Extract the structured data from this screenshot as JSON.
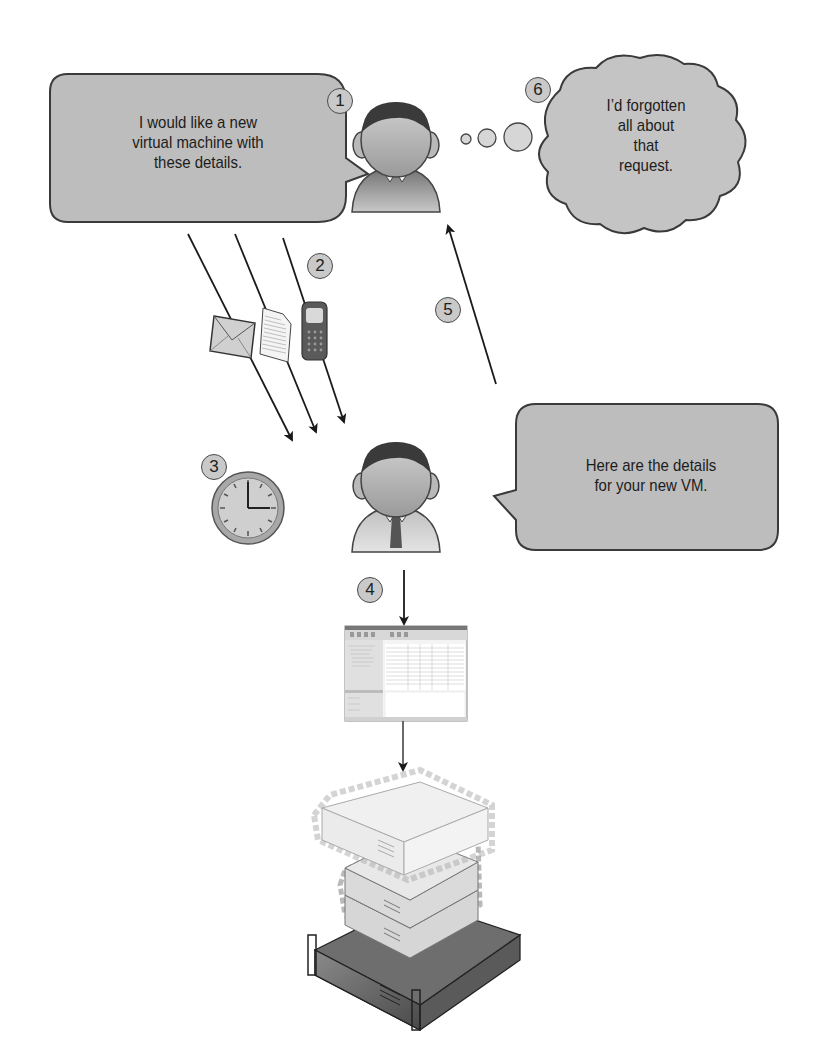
{
  "diagram": {
    "steps": [
      {
        "number": "1",
        "label": "Requester asks for a new VM"
      },
      {
        "number": "2",
        "label": "Request sent via email, document, or phone"
      },
      {
        "number": "3",
        "label": "Waiting time"
      },
      {
        "number": "4",
        "label": "Administrator provisions VM via management console"
      },
      {
        "number": "5",
        "label": "Administrator returns VM details"
      },
      {
        "number": "6",
        "label": "Requester has forgotten the request"
      }
    ],
    "bubbles": {
      "requester_speech": {
        "line1": "I would like a new",
        "line2": "virtual machine with",
        "line3": "these details."
      },
      "requester_thought": {
        "line1": "I’d forgotten",
        "line2": "all about",
        "line3": "that",
        "line4": "request."
      },
      "admin_speech": {
        "line1": "Here are the details",
        "line2": "for your new VM."
      }
    },
    "icons": {
      "requester": "person-icon",
      "admin": "person-with-tie-icon",
      "email": "envelope-icon",
      "document": "document-icon",
      "phone": "mobile-phone-icon",
      "clock": "clock-icon",
      "console": "management-console-screenshot",
      "servers": "server-stack-icon"
    },
    "colors": {
      "bubble_fill": "#bdbdbd",
      "bubble_stroke": "#3a3a3a",
      "step_fill": "#c9c9c9",
      "arrow": "#1a1a1a"
    }
  }
}
